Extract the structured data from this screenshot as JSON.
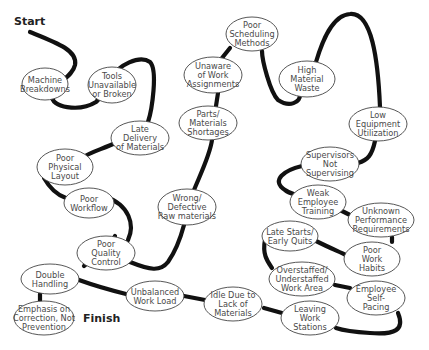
{
  "labels": {
    "start": "Start",
    "finish": "Finish"
  },
  "colors": {
    "path": "#111111",
    "node_border": "#444444",
    "node_text": "#4a4a4a",
    "background": "#ffffff"
  },
  "nodes": [
    {
      "id": "machine-breakdowns",
      "lines": [
        "Machine",
        "Breakdowns"
      ],
      "cx": 45,
      "cy": 84,
      "rx": 23,
      "ry": 16
    },
    {
      "id": "tools-unavailable",
      "lines": [
        "Tools",
        "Unavailable",
        "or Broken"
      ],
      "cx": 112,
      "cy": 85,
      "rx": 24,
      "ry": 18
    },
    {
      "id": "late-delivery",
      "lines": [
        "Late",
        "Delivery",
        "of Materials"
      ],
      "cx": 140,
      "cy": 138,
      "rx": 29,
      "ry": 17
    },
    {
      "id": "poor-physical-layout",
      "lines": [
        "Poor",
        "Physical",
        "Layout"
      ],
      "cx": 65,
      "cy": 167,
      "rx": 28,
      "ry": 18
    },
    {
      "id": "poor-workflow",
      "lines": [
        "Poor",
        "Workflow"
      ],
      "cx": 89,
      "cy": 203,
      "rx": 25,
      "ry": 15
    },
    {
      "id": "poor-quality-control",
      "lines": [
        "Poor",
        "Quality",
        "Control"
      ],
      "cx": 106,
      "cy": 253,
      "rx": 29,
      "ry": 17
    },
    {
      "id": "double-handling",
      "lines": [
        "Double",
        "Handling"
      ],
      "cx": 50,
      "cy": 279,
      "rx": 29,
      "ry": 15
    },
    {
      "id": "emphasis-on-correction",
      "lines": [
        "Emphasis on",
        "Correction, Not",
        "Prevention"
      ],
      "cx": 44,
      "cy": 318,
      "rx": 30,
      "ry": 17
    },
    {
      "id": "unbalanced-work-load",
      "lines": [
        "Unbalanced",
        "Work Load"
      ],
      "cx": 155,
      "cy": 296,
      "rx": 29,
      "ry": 15
    },
    {
      "id": "idle-due-to-lack",
      "lines": [
        "Idle Due to",
        "Lack of",
        "Materials"
      ],
      "cx": 233,
      "cy": 304,
      "rx": 29,
      "ry": 17
    },
    {
      "id": "leaving-work-stations",
      "lines": [
        "Leaving",
        "Work",
        "Stations"
      ],
      "cx": 310,
      "cy": 318,
      "rx": 29,
      "ry": 17
    },
    {
      "id": "employee-self-pacing",
      "lines": [
        "Employee",
        "Self-",
        "Pacing"
      ],
      "cx": 376,
      "cy": 298,
      "rx": 29,
      "ry": 17
    },
    {
      "id": "overstaffed-understaffed",
      "lines": [
        "Overstaffed/",
        "Understaffed",
        "Work Area"
      ],
      "cx": 302,
      "cy": 279,
      "rx": 33,
      "ry": 17
    },
    {
      "id": "late-starts",
      "lines": [
        "Late Starts/",
        "Early Quits"
      ],
      "cx": 290,
      "cy": 236,
      "rx": 28,
      "ry": 15
    },
    {
      "id": "poor-work-habits",
      "lines": [
        "Poor",
        "Work",
        "Habits"
      ],
      "cx": 372,
      "cy": 259,
      "rx": 28,
      "ry": 17
    },
    {
      "id": "unknown-performance",
      "lines": [
        "Unknown",
        "Performance",
        "Requirements"
      ],
      "cx": 381,
      "cy": 220,
      "rx": 33,
      "ry": 17
    },
    {
      "id": "weak-employee-training",
      "lines": [
        "Weak",
        "Employee",
        "Training"
      ],
      "cx": 318,
      "cy": 202,
      "rx": 28,
      "ry": 17
    },
    {
      "id": "supervisors-not-supervising",
      "lines": [
        "Supervisors",
        "Not",
        "Supervising"
      ],
      "cx": 330,
      "cy": 164,
      "rx": 29,
      "ry": 17
    },
    {
      "id": "low-equipment-utilization",
      "lines": [
        "Low",
        "Equipment",
        "Utilization"
      ],
      "cx": 378,
      "cy": 124,
      "rx": 29,
      "ry": 17
    },
    {
      "id": "high-material-waste",
      "lines": [
        "High",
        "Material",
        "Waste"
      ],
      "cx": 307,
      "cy": 79,
      "rx": 28,
      "ry": 18
    },
    {
      "id": "poor-scheduling-methods",
      "lines": [
        "Poor",
        "Scheduling",
        "Methods"
      ],
      "cx": 252,
      "cy": 34,
      "rx": 26,
      "ry": 17
    },
    {
      "id": "unaware-of-work",
      "lines": [
        "Unaware",
        "of Work",
        "Assignments"
      ],
      "cx": 213,
      "cy": 75,
      "rx": 29,
      "ry": 18
    },
    {
      "id": "parts-materials-shortages",
      "lines": [
        "Parts/",
        "Materials",
        "Shortages"
      ],
      "cx": 208,
      "cy": 123,
      "rx": 29,
      "ry": 17
    },
    {
      "id": "wrong-defective-raw",
      "lines": [
        "Wrong/",
        "Defective",
        "Raw materials"
      ],
      "cx": 187,
      "cy": 207,
      "rx": 29,
      "ry": 18
    }
  ]
}
